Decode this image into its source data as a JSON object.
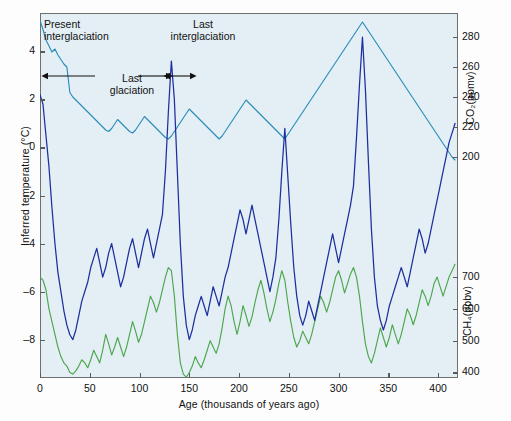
{
  "figure": {
    "background_color": "#e4eff5",
    "frame_color": "#6f6f6f"
  },
  "axes": {
    "x": {
      "label": "Age (thousands of years ago)",
      "ticks": [
        0,
        50,
        100,
        150,
        200,
        250,
        300,
        350,
        400
      ],
      "range": [
        0,
        420
      ]
    },
    "y_left": {
      "label": "Inferred temperature (°C)",
      "ticks": [
        4,
        2,
        0,
        -2,
        -4,
        -6,
        -8
      ],
      "tick_labels": [
        "4",
        "2",
        "0",
        "–2",
        "–4",
        "–6",
        "–8"
      ],
      "range": [
        -9.6,
        5.6
      ]
    },
    "y_right_top": {
      "label": "CO₂(ppmv)",
      "ticks": [
        280,
        260,
        240,
        220,
        200
      ],
      "range": [
        188,
        296
      ]
    },
    "y_right_bottom": {
      "label": "CH₄(ppbv)",
      "ticks": [
        700,
        600,
        500,
        400
      ],
      "range": [
        370,
        760
      ]
    }
  },
  "annotations": [
    {
      "name": "present-interglaciation",
      "line1": "Present",
      "line2": "interglaciation"
    },
    {
      "name": "last-interglaciation",
      "line1": "Last",
      "line2": "interglaciation"
    },
    {
      "name": "last-glaciation",
      "line1": "Last",
      "line2": "glaciation"
    }
  ],
  "chart_data": {
    "type": "line",
    "title": "",
    "xlabel": "Age (thousands of years ago)",
    "xlim": [
      0,
      420
    ],
    "grid": false,
    "legend": "none",
    "series": [
      {
        "name": "CO2",
        "color": "#2b8cb8",
        "ylabel": "CO₂(ppmv)",
        "units": "ppmv",
        "ylim": [
          188,
          296
        ],
        "axis": "right-top",
        "x": [
          0,
          3,
          6,
          9,
          12,
          15,
          18,
          21,
          24,
          27,
          30,
          33,
          36,
          39,
          42,
          45,
          48,
          51,
          54,
          57,
          60,
          63,
          66,
          69,
          72,
          75,
          78,
          81,
          84,
          87,
          90,
          93,
          96,
          99,
          102,
          105,
          108,
          111,
          114,
          117,
          120,
          123,
          126,
          129,
          132,
          135,
          138,
          141,
          144,
          147,
          150,
          153,
          156,
          159,
          162,
          165,
          168,
          171,
          174,
          177,
          180,
          183,
          186,
          189,
          192,
          195,
          198,
          201,
          204,
          207,
          210,
          213,
          216,
          219,
          222,
          225,
          228,
          231,
          234,
          237,
          240,
          243,
          246,
          249,
          252,
          255,
          258,
          261,
          264,
          267,
          270,
          273,
          276,
          279,
          282,
          285,
          288,
          291,
          294,
          297,
          300,
          303,
          306,
          309,
          312,
          315,
          318,
          321,
          324,
          327,
          330,
          333,
          336,
          339,
          342,
          345,
          348,
          351,
          354,
          357,
          360,
          363,
          366,
          369,
          372,
          375,
          378,
          381,
          384,
          387,
          390,
          393,
          396,
          399,
          402,
          405,
          408,
          411,
          414,
          417
        ],
        "values": [
          291,
          285,
          278,
          274,
          270,
          272,
          268,
          265,
          262,
          260,
          243,
          240,
          238,
          236,
          234,
          232,
          230,
          228,
          226,
          224,
          222,
          220,
          218,
          217,
          219,
          222,
          225,
          223,
          221,
          219,
          217,
          216,
          218,
          221,
          224,
          227,
          225,
          223,
          221,
          219,
          217,
          215,
          213,
          212,
          214,
          217,
          220,
          223,
          226,
          229,
          232,
          230,
          228,
          226,
          224,
          222,
          220,
          218,
          216,
          214,
          212,
          214,
          217,
          220,
          223,
          226,
          229,
          232,
          235,
          238,
          236,
          234,
          232,
          230,
          228,
          226,
          224,
          222,
          220,
          218,
          216,
          214,
          212,
          215,
          218,
          221,
          224,
          227,
          230,
          233,
          236,
          239,
          242,
          245,
          248,
          251,
          254,
          257,
          260,
          263,
          266,
          269,
          272,
          275,
          278,
          281,
          284,
          287,
          290,
          287,
          284,
          281,
          278,
          275,
          272,
          269,
          266,
          263,
          260,
          257,
          254,
          251,
          248,
          245,
          242,
          239,
          236,
          233,
          230,
          227,
          224,
          221,
          218,
          215,
          212,
          209,
          206,
          203,
          200,
          198
        ]
      },
      {
        "name": "Inferred temperature",
        "color": "#1c2f9e",
        "ylabel": "Inferred temperature (°C)",
        "units": "°C",
        "ylim": [
          -9.6,
          5.6
        ],
        "axis": "left",
        "x": [
          0,
          3,
          6,
          9,
          12,
          15,
          18,
          21,
          24,
          27,
          30,
          33,
          36,
          39,
          42,
          45,
          48,
          51,
          54,
          57,
          60,
          63,
          66,
          69,
          72,
          75,
          78,
          81,
          84,
          87,
          90,
          93,
          96,
          99,
          102,
          105,
          108,
          111,
          114,
          117,
          120,
          123,
          126,
          129,
          132,
          135,
          138,
          141,
          144,
          147,
          150,
          153,
          156,
          159,
          162,
          165,
          168,
          171,
          174,
          177,
          180,
          183,
          186,
          189,
          192,
          195,
          198,
          201,
          204,
          207,
          210,
          213,
          216,
          219,
          222,
          225,
          228,
          231,
          234,
          237,
          240,
          243,
          246,
          249,
          252,
          255,
          258,
          261,
          264,
          267,
          270,
          273,
          276,
          279,
          282,
          285,
          288,
          291,
          294,
          297,
          300,
          303,
          306,
          309,
          312,
          315,
          318,
          321,
          324,
          327,
          330,
          333,
          336,
          339,
          342,
          345,
          348,
          351,
          354,
          357,
          360,
          363,
          366,
          369,
          372,
          375,
          378,
          381,
          384,
          387,
          390,
          393,
          396,
          399,
          402,
          405,
          408,
          411,
          414,
          417
        ],
        "values": [
          2.2,
          1.8,
          0.5,
          -0.8,
          -2.5,
          -4.0,
          -5.2,
          -6.0,
          -6.8,
          -7.4,
          -7.8,
          -8.0,
          -7.6,
          -7.0,
          -6.4,
          -6.0,
          -5.6,
          -5.0,
          -4.6,
          -4.2,
          -4.8,
          -5.4,
          -5.0,
          -4.4,
          -4.0,
          -4.6,
          -5.2,
          -5.8,
          -5.4,
          -4.8,
          -4.2,
          -3.8,
          -4.4,
          -5.0,
          -4.4,
          -3.8,
          -3.4,
          -4.0,
          -4.6,
          -4.0,
          -3.4,
          -2.8,
          -1.0,
          1.5,
          3.6,
          2.0,
          -1.0,
          -4.0,
          -6.2,
          -7.4,
          -8.0,
          -7.6,
          -7.0,
          -6.6,
          -6.2,
          -6.6,
          -7.0,
          -6.4,
          -5.8,
          -6.2,
          -6.6,
          -6.0,
          -5.4,
          -5.0,
          -4.4,
          -3.8,
          -3.2,
          -2.6,
          -3.0,
          -3.6,
          -3.0,
          -2.4,
          -3.0,
          -3.6,
          -4.2,
          -4.8,
          -5.4,
          -6.0,
          -5.4,
          -4.6,
          -3.0,
          -1.0,
          0.8,
          -1.2,
          -3.2,
          -5.0,
          -6.2,
          -7.0,
          -7.4,
          -7.0,
          -6.4,
          -6.8,
          -7.2,
          -6.6,
          -6.0,
          -5.4,
          -4.8,
          -4.2,
          -3.6,
          -4.2,
          -4.8,
          -4.2,
          -3.6,
          -3.0,
          -2.4,
          -1.6,
          0.4,
          2.6,
          4.6,
          2.4,
          -0.6,
          -3.4,
          -5.4,
          -6.6,
          -7.2,
          -7.6,
          -7.2,
          -6.6,
          -6.2,
          -5.8,
          -5.4,
          -5.0,
          -5.4,
          -5.8,
          -5.2,
          -4.6,
          -4.0,
          -3.4,
          -3.8,
          -4.4,
          -4.0,
          -3.4,
          -2.8,
          -2.2,
          -1.6,
          -1.0,
          -0.4,
          0.2,
          0.6,
          1.0
        ]
      },
      {
        "name": "CH4",
        "color": "#4ca64c",
        "ylabel": "CH₄(ppbv)",
        "units": "ppbv",
        "ylim": [
          370,
          760
        ],
        "axis": "right-bottom",
        "x": [
          0,
          3,
          6,
          9,
          12,
          15,
          18,
          21,
          24,
          27,
          30,
          33,
          36,
          39,
          42,
          45,
          48,
          51,
          54,
          57,
          60,
          63,
          66,
          69,
          72,
          75,
          78,
          81,
          84,
          87,
          90,
          93,
          96,
          99,
          102,
          105,
          108,
          111,
          114,
          117,
          120,
          123,
          126,
          129,
          132,
          135,
          138,
          141,
          144,
          147,
          150,
          153,
          156,
          159,
          162,
          165,
          168,
          171,
          174,
          177,
          180,
          183,
          186,
          189,
          192,
          195,
          198,
          201,
          204,
          207,
          210,
          213,
          216,
          219,
          222,
          225,
          228,
          231,
          234,
          237,
          240,
          243,
          246,
          249,
          252,
          255,
          258,
          261,
          264,
          267,
          270,
          273,
          276,
          279,
          282,
          285,
          288,
          291,
          294,
          297,
          300,
          303,
          306,
          309,
          312,
          315,
          318,
          321,
          324,
          327,
          330,
          333,
          336,
          339,
          342,
          345,
          348,
          351,
          354,
          357,
          360,
          363,
          366,
          369,
          372,
          375,
          378,
          381,
          384,
          387,
          390,
          393,
          396,
          399,
          402,
          405,
          408,
          411,
          414,
          417
        ],
        "values": [
          700,
          690,
          660,
          600,
          560,
          520,
          480,
          450,
          430,
          420,
          400,
          395,
          405,
          420,
          440,
          430,
          415,
          440,
          470,
          450,
          430,
          470,
          520,
          490,
          455,
          480,
          510,
          480,
          450,
          480,
          520,
          560,
          530,
          495,
          520,
          560,
          600,
          640,
          620,
          590,
          620,
          660,
          700,
          730,
          720,
          640,
          520,
          430,
          395,
          385,
          400,
          420,
          450,
          430,
          415,
          440,
          470,
          500,
          480,
          460,
          490,
          540,
          600,
          640,
          610,
          560,
          520,
          560,
          610,
          580,
          545,
          575,
          620,
          660,
          690,
          650,
          600,
          560,
          590,
          630,
          680,
          720,
          690,
          620,
          560,
          510,
          480,
          500,
          530,
          510,
          490,
          520,
          560,
          600,
          640,
          620,
          590,
          620,
          660,
          700,
          720,
          690,
          650,
          680,
          710,
          730,
          700,
          640,
          560,
          490,
          450,
          430,
          460,
          500,
          540,
          510,
          480,
          510,
          550,
          520,
          490,
          520,
          560,
          600,
          580,
          550,
          580,
          620,
          660,
          640,
          610,
          640,
          680,
          700,
          670,
          640,
          670,
          700,
          720,
          740
        ]
      }
    ]
  }
}
